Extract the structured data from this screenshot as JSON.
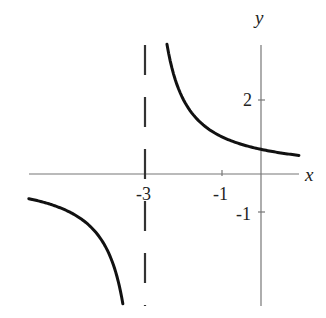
{
  "chart_data": {
    "type": "line",
    "title": "",
    "xlabel": "x",
    "ylabel": "y",
    "function": "y = 2/(x+3)",
    "xlim": [
      -6,
      1
    ],
    "ylim": [
      -3.5,
      3.5
    ],
    "grid": false,
    "legend": null,
    "x_ticks": [
      {
        "value": -3,
        "label": "-3"
      },
      {
        "value": -1,
        "label": "-1"
      }
    ],
    "y_ticks": [
      {
        "value": 2,
        "label": "2"
      },
      {
        "value": -1,
        "label": "-1"
      }
    ],
    "vertical_asymptote": {
      "x": -3,
      "style": "dashed"
    },
    "horizontal_asymptote": {
      "y": 0
    },
    "series": [
      {
        "name": "right-branch",
        "x": [
          -2.43,
          -2.25,
          -2,
          -1.5,
          -1,
          -0.5,
          0,
          0.5,
          1
        ],
        "y": [
          3.5,
          2.67,
          2.0,
          1.33,
          1.0,
          0.8,
          0.67,
          0.57,
          0.5
        ]
      },
      {
        "name": "left-branch",
        "x": [
          -6,
          -5.5,
          -5,
          -4.5,
          -4,
          -3.75,
          -3.57
        ],
        "y": [
          -0.67,
          -0.8,
          -1.0,
          -1.33,
          -2.0,
          -2.67,
          -3.5
        ]
      }
    ]
  },
  "labels": {
    "x_axis": "x",
    "y_axis": "y",
    "tick_x_neg3": "-3",
    "tick_x_neg1": "-1",
    "tick_y_2": "2",
    "tick_y_neg1": "-1"
  }
}
